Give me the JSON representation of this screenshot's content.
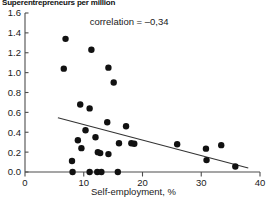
{
  "chart_data": {
    "type": "scatter",
    "title": "Superentrepreneurs per million",
    "xlabel": "Self-employment, %",
    "ylabel": "",
    "xlim": [
      0,
      40
    ],
    "ylim": [
      0.0,
      1.6
    ],
    "xticks": [
      0,
      10,
      20,
      30,
      40
    ],
    "xtick_labels": [
      "0",
      "10",
      "20",
      "30",
      "40"
    ],
    "yticks": [
      0.0,
      0.2,
      0.4,
      0.6,
      0.8,
      1.0,
      1.2,
      1.4,
      1.6
    ],
    "ytick_labels": [
      "0.0",
      "0.2",
      "0.4",
      "0.6",
      "0.8",
      "1.0",
      "1.2",
      "1.4",
      "1.6"
    ],
    "grid": false,
    "legend": false,
    "annotations": [
      {
        "name": "correlation-annotation",
        "text": "correlation = –0,34",
        "x": 11.0,
        "y": 1.48
      }
    ],
    "points": [
      {
        "x": 6.9,
        "y": 1.34
      },
      {
        "x": 6.6,
        "y": 1.04
      },
      {
        "x": 11.3,
        "y": 1.23
      },
      {
        "x": 14.2,
        "y": 1.05
      },
      {
        "x": 15.1,
        "y": 0.9
      },
      {
        "x": 9.4,
        "y": 0.68
      },
      {
        "x": 11.0,
        "y": 0.64
      },
      {
        "x": 14.0,
        "y": 0.5
      },
      {
        "x": 17.2,
        "y": 0.46
      },
      {
        "x": 10.3,
        "y": 0.42
      },
      {
        "x": 12.0,
        "y": 0.35
      },
      {
        "x": 9.0,
        "y": 0.32
      },
      {
        "x": 16.0,
        "y": 0.29
      },
      {
        "x": 18.1,
        "y": 0.29
      },
      {
        "x": 18.6,
        "y": 0.285
      },
      {
        "x": 25.9,
        "y": 0.28
      },
      {
        "x": 33.4,
        "y": 0.27
      },
      {
        "x": 9.6,
        "y": 0.24
      },
      {
        "x": 30.8,
        "y": 0.235
      },
      {
        "x": 12.4,
        "y": 0.2
      },
      {
        "x": 12.8,
        "y": 0.19
      },
      {
        "x": 14.2,
        "y": 0.18
      },
      {
        "x": 30.9,
        "y": 0.12
      },
      {
        "x": 8.0,
        "y": 0.11
      },
      {
        "x": 35.8,
        "y": 0.055
      },
      {
        "x": 8.1,
        "y": 0.0
      },
      {
        "x": 11.0,
        "y": 0.0
      },
      {
        "x": 12.3,
        "y": 0.0
      },
      {
        "x": 13.0,
        "y": 0.0
      },
      {
        "x": 15.8,
        "y": 0.0
      }
    ],
    "trend_line": {
      "name": "regression-line",
      "x0": 5.6,
      "y0": 0.545,
      "x1": 38.0,
      "y1": 0.04
    },
    "point_color": "#111111",
    "line_color": "#333333",
    "axis_color": "#4d4d4d"
  }
}
